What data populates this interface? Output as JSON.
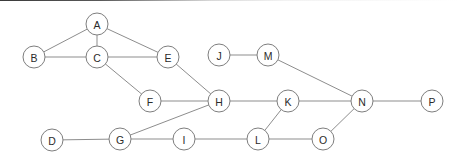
{
  "diagram": {
    "type": "node-link-graph",
    "background_color": "#ffffff",
    "node_fill_color": "#ffffff",
    "node_stroke_color": "#7e7e7e",
    "edge_color": "#8d8d8d",
    "label_color": "#2b2b2b",
    "node_radius": 11,
    "node_count": 16,
    "edge_count": 19
  },
  "nodes": [
    {
      "id": "A",
      "label": "A",
      "x": 97,
      "y": 24
    },
    {
      "id": "B",
      "label": "B",
      "x": 34,
      "y": 57
    },
    {
      "id": "C",
      "label": "C",
      "x": 97,
      "y": 57
    },
    {
      "id": "E",
      "label": "E",
      "x": 168,
      "y": 57
    },
    {
      "id": "J",
      "label": "J",
      "x": 219,
      "y": 55
    },
    {
      "id": "M",
      "label": "M",
      "x": 268,
      "y": 55
    },
    {
      "id": "F",
      "label": "F",
      "x": 150,
      "y": 101
    },
    {
      "id": "H",
      "label": "H",
      "x": 219,
      "y": 101
    },
    {
      "id": "K",
      "label": "K",
      "x": 288,
      "y": 101
    },
    {
      "id": "N",
      "label": "N",
      "x": 362,
      "y": 101
    },
    {
      "id": "P",
      "label": "P",
      "x": 432,
      "y": 101
    },
    {
      "id": "D",
      "label": "D",
      "x": 52,
      "y": 140
    },
    {
      "id": "G",
      "label": "G",
      "x": 120,
      "y": 139
    },
    {
      "id": "I",
      "label": "I",
      "x": 184,
      "y": 139
    },
    {
      "id": "L",
      "label": "L",
      "x": 258,
      "y": 139
    },
    {
      "id": "O",
      "label": "O",
      "x": 323,
      "y": 139
    }
  ],
  "edges": [
    {
      "from": "A",
      "to": "B"
    },
    {
      "from": "A",
      "to": "C"
    },
    {
      "from": "A",
      "to": "E"
    },
    {
      "from": "B",
      "to": "C"
    },
    {
      "from": "C",
      "to": "E"
    },
    {
      "from": "C",
      "to": "F"
    },
    {
      "from": "E",
      "to": "H"
    },
    {
      "from": "F",
      "to": "H"
    },
    {
      "from": "J",
      "to": "M"
    },
    {
      "from": "M",
      "to": "N"
    },
    {
      "from": "H",
      "to": "G"
    },
    {
      "from": "H",
      "to": "K"
    },
    {
      "from": "K",
      "to": "N"
    },
    {
      "from": "K",
      "to": "L"
    },
    {
      "from": "N",
      "to": "P"
    },
    {
      "from": "N",
      "to": "O"
    },
    {
      "from": "D",
      "to": "G"
    },
    {
      "from": "G",
      "to": "I"
    },
    {
      "from": "I",
      "to": "L"
    },
    {
      "from": "L",
      "to": "O"
    }
  ]
}
